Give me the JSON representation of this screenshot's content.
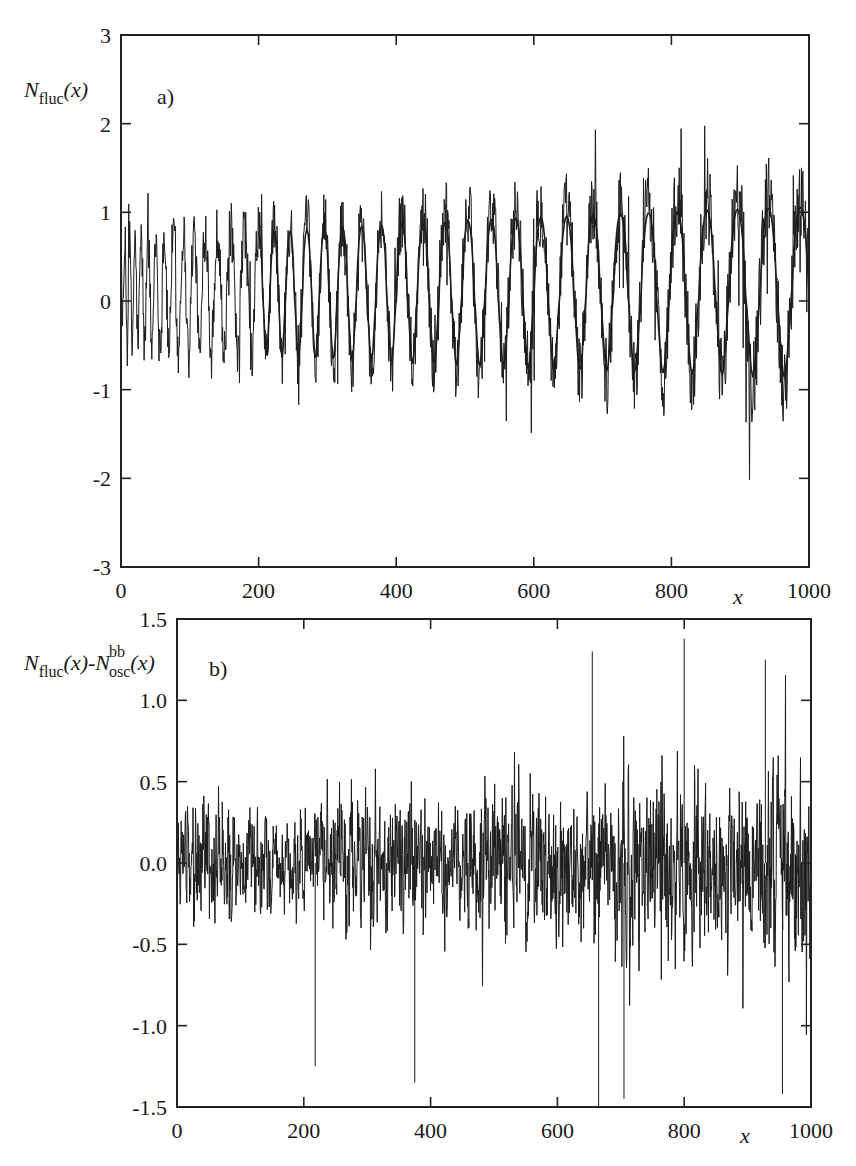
{
  "chart_data": [
    {
      "panel": "a",
      "type": "line",
      "panel_tag": "a)",
      "ylabel": "N_fluc(x)",
      "ylabel_parts": {
        "base": "N",
        "sub": "fluc",
        "arg": "(x)"
      },
      "xlabel": "x",
      "xlim": [
        0,
        1000
      ],
      "ylim": [
        -3,
        3
      ],
      "xticks": [
        0,
        200,
        400,
        600,
        800,
        1000
      ],
      "xtick_labels": [
        "0",
        "200",
        "400",
        "600",
        "800",
        "1000"
      ],
      "yticks": [
        -3,
        -2,
        -1,
        0,
        1,
        2,
        3
      ],
      "ytick_labels": [
        "-3",
        "-2",
        "-1",
        "0",
        "1",
        "2",
        "3"
      ],
      "grid": false,
      "legend": null,
      "series": [
        {
          "name": "N_fluc(x) (noisy staircase fluctuation)",
          "style": "thin jagged line",
          "description": "Noisy oscillating signal with sawtooth-like dips whose period grows with x; envelope widens from about ±1 near x=0 to about -3..+2.4 near x=1000",
          "approx_trough_x": [
            30,
            62,
            95,
            130,
            168,
            205,
            245,
            285,
            330,
            375,
            420,
            470,
            520,
            575,
            630,
            690,
            755,
            825,
            900,
            965
          ],
          "approx_trough_y": [
            -1.0,
            -1.3,
            -1.6,
            -1.5,
            -1.9,
            -2.1,
            -2.4,
            -1.9,
            -2.0,
            -2.0,
            -2.1,
            -2.5,
            -2.2,
            -2.2,
            -2.3,
            -2.6,
            -3.0,
            -2.6
          ],
          "approx_peak_max": [
            1.0,
            1.4,
            1.8,
            1.8,
            1.9,
            2.1,
            2.2,
            2.4,
            2.4,
            2.2
          ]
        },
        {
          "name": "N_osc^bb(x) (smooth oscillation)",
          "style": "smooth line",
          "description": "Smooth quasi-periodic curve following the mean of N_fluc, peaks near +1.1, troughs near -2, period increasing with x"
        }
      ]
    },
    {
      "panel": "b",
      "type": "line",
      "panel_tag": "b)",
      "ylabel": "N_fluc(x)-N_osc^bb(x)",
      "ylabel_parts": {
        "base1": "N",
        "sub1": "fluc",
        "arg1": "(x)-",
        "base2": "N",
        "sub2": "osc",
        "sup2": "bb",
        "arg2": "(x)"
      },
      "xlabel": "x",
      "xlim": [
        0,
        1000
      ],
      "ylim": [
        -1.5,
        1.5
      ],
      "xticks": [
        0,
        200,
        400,
        600,
        800,
        1000
      ],
      "xtick_labels": [
        "0",
        "200",
        "400",
        "600",
        "800",
        "1000"
      ],
      "yticks": [
        -1.5,
        -1.0,
        -0.5,
        0.0,
        0.5,
        1.0,
        1.5
      ],
      "ytick_labels": [
        "-1.5",
        "-1.0",
        "-0.5",
        "0.0",
        "0.5",
        "1.0",
        "1.5"
      ],
      "grid": false,
      "legend": null,
      "series": [
        {
          "name": "N_fluc(x) - N_osc^bb(x)",
          "style": "thin jagged line",
          "description": "Dense noise centred at 0; amplitude grows from about ±0.5 near x=0 to about ±1.2 near x=1000, with max spike ~1.4 near x=800 and min ~-1.5 near x=665",
          "approx_extremes": [
            {
              "x": 218,
              "y": -1.25
            },
            {
              "x": 375,
              "y": -1.35
            },
            {
              "x": 665,
              "y": -1.5
            },
            {
              "x": 705,
              "y": -1.45
            },
            {
              "x": 655,
              "y": 1.3
            },
            {
              "x": 800,
              "y": 1.38
            },
            {
              "x": 928,
              "y": 1.25
            },
            {
              "x": 955,
              "y": -1.42
            }
          ]
        }
      ]
    }
  ],
  "figure": {
    "panels": [
      {
        "id": "a",
        "frame": {
          "x": 121,
          "y": 35,
          "w": 688,
          "h": 532
        }
      },
      {
        "id": "b",
        "frame": {
          "x": 177,
          "y": 619,
          "w": 634,
          "h": 488
        }
      }
    ],
    "line_color": "#1c1c1c",
    "background": "#ffffff"
  }
}
